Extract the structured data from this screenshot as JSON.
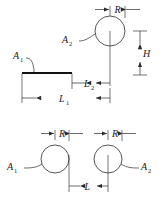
{
  "figure": {
    "line_color": "#2b2b2b",
    "surface_color": "#111111",
    "background": "#ffffff",
    "panels": [
      {
        "name": "top-panel",
        "description": "Cylinder above a finite plate",
        "labels": {
          "surface_a1": "A",
          "surface_a1_sub": "1",
          "surface_a2": "A",
          "surface_a2_sub": "2",
          "radius": "R",
          "height": "H",
          "length_1": "L",
          "length_1_sub": "1",
          "length_2": "L",
          "length_2_sub": "2"
        }
      },
      {
        "name": "bottom-panel",
        "description": "Two parallel cylinders separated by a distance",
        "labels": {
          "surface_a1": "A",
          "surface_a1_sub": "1",
          "surface_a2": "A",
          "surface_a2_sub": "2",
          "radius_left": "R",
          "radius_right": "R",
          "separation": "L"
        }
      }
    ]
  },
  "geometry": {
    "top_circle": {
      "cx": 110,
      "cy": 31,
      "r": 15
    },
    "plate": {
      "x1": 22,
      "x2": 72,
      "y": 73
    },
    "bottom_circle_left": {
      "cx": 55,
      "cy": 159,
      "r": 14
    },
    "bottom_circle_right": {
      "cx": 108,
      "cy": 159,
      "r": 14
    }
  }
}
